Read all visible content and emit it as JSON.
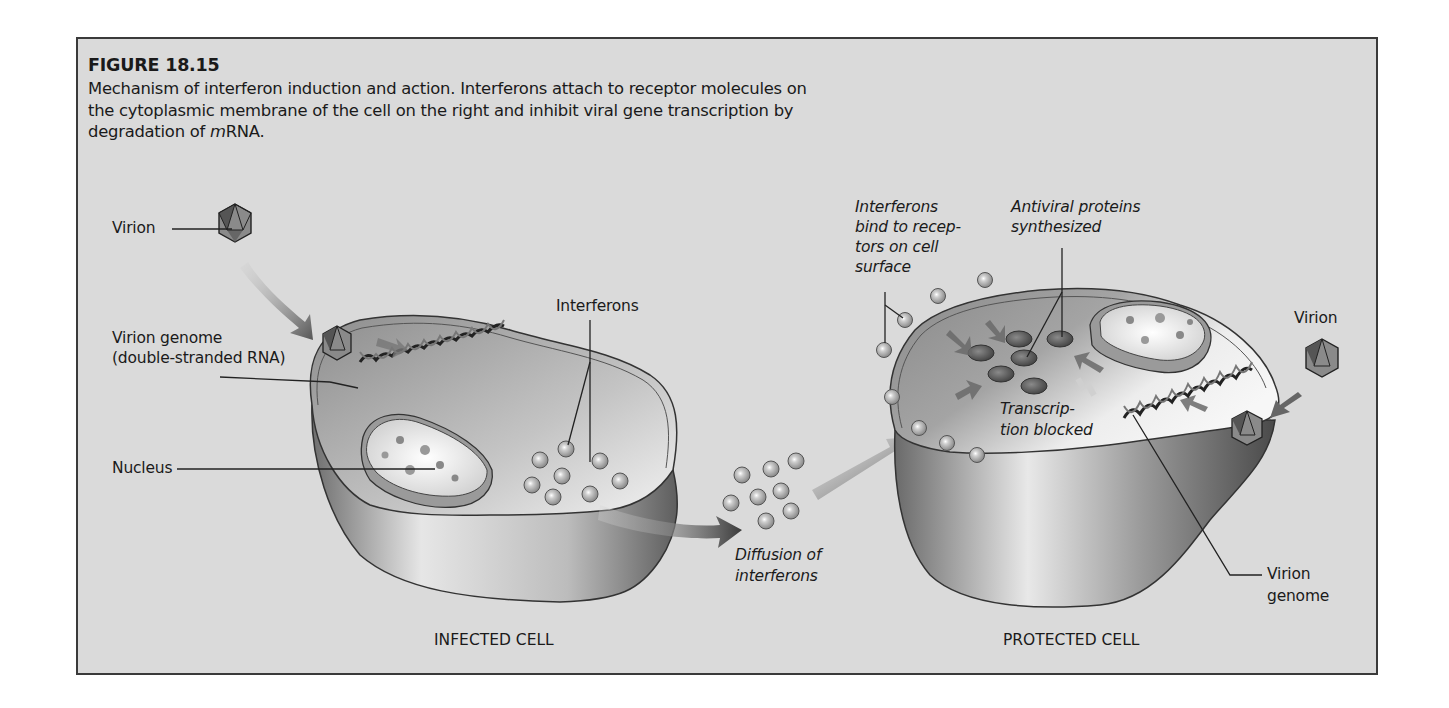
{
  "figure": {
    "title": "FIGURE 18.15",
    "caption_parts": [
      "Mechanism of interferon induction and action. Interferons attach to receptor molecules on the cytoplasmic membrane of the cell on the right and inhibit viral gene transcription by degradation of ",
      "m",
      "RNA."
    ]
  },
  "infected_cell": {
    "name": "INFECTED CELL",
    "labels": {
      "virion": "Virion",
      "virion_genome_line1": "Virion genome",
      "virion_genome_line2": "(double-stranded RNA)",
      "nucleus": "Nucleus",
      "interferons": "Interferons"
    }
  },
  "diffusion": {
    "label_line1": "Diffusion of",
    "label_line2": "interferons"
  },
  "protected_cell": {
    "name": "PROTECTED CELL",
    "labels": {
      "bind_line1": "Interferons",
      "bind_line2": "bind to recep-",
      "bind_line3": "tors on cell",
      "bind_line4": "surface",
      "antiviral_line1": "Antiviral proteins",
      "antiviral_line2": "synthesized",
      "transcription_line1": "Transcrip-",
      "transcription_line2": "tion blocked",
      "virion": "Virion",
      "virion_genome_line1": "Virion",
      "virion_genome_line2": "genome"
    }
  },
  "colors": {
    "panel_bg": "#dadada",
    "border": "#3a3a3a",
    "text": "#1a1a1a"
  }
}
